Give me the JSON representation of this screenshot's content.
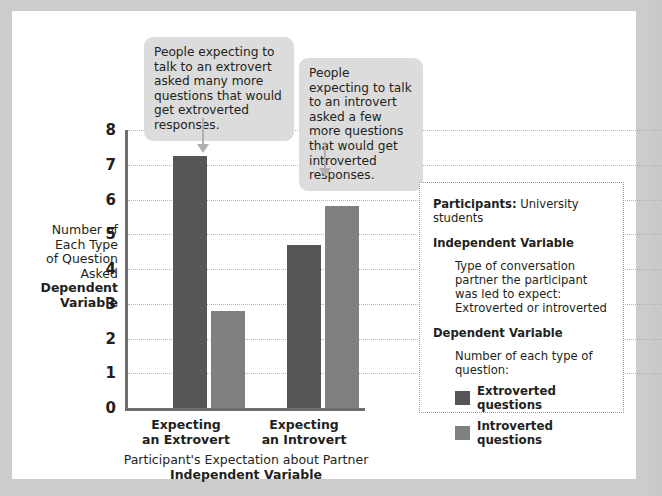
{
  "chart_data": {
    "type": "bar",
    "title": "",
    "categories": [
      "Expecting an Extrovert",
      "Expecting an Introvert"
    ],
    "series": [
      {
        "name": "Extroverted questions",
        "values": [
          7.25,
          4.7
        ],
        "color": "#565656"
      },
      {
        "name": "Introverted questions",
        "values": [
          2.8,
          5.8
        ],
        "color": "#808080"
      }
    ],
    "ylabel": "Number of Each Type of Question Asked",
    "ylabel_bold": "Dependent Variable",
    "xlabel": "Participant's Expectation about Partner",
    "xlabel_bold": "Independent Variable",
    "ylim": [
      0,
      8
    ],
    "yticks": [
      "8",
      "7",
      "6",
      "5",
      "4",
      "3",
      "2",
      "1",
      "0"
    ],
    "grid": true,
    "legend_position": "right"
  },
  "axes": {
    "y_title_line_1": "Number of",
    "y_title_line_2": "Each Type",
    "y_title_line_3": "of Question",
    "y_title_line_4": "Asked",
    "y_title_bold_1": "Dependent",
    "y_title_bold_2": "Variable",
    "x_cat_0_line_1": "Expecting",
    "x_cat_0_line_2": "an Extrovert",
    "x_cat_1_line_1": "Expecting",
    "x_cat_1_line_2": "an Introvert",
    "x_title": "Participant's Expectation about Partner",
    "x_title_bold": "Independent Variable"
  },
  "callouts": [
    {
      "text": "People expecting to talk to an extrovert asked many more questions that would get extroverted responses."
    },
    {
      "text": "People expecting to talk to an introvert asked a few more questions that would get introverted responses."
    }
  ],
  "infobox": {
    "participants_label": "Participants:",
    "participants_value": "University students",
    "independent_variable_title": "Independent Variable",
    "independent_variable_text": "Type of conversation partner the participant was led to expect: Extroverted or introverted",
    "dependent_variable_title": "Dependent Variable",
    "dependent_variable_text": "Number of each type of question:",
    "legend": [
      {
        "label": "Extroverted questions",
        "color": "#565656"
      },
      {
        "label": "Introverted questions",
        "color": "#808080"
      }
    ]
  }
}
